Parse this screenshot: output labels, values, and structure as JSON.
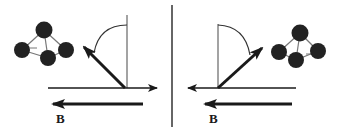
{
  "figure": {
    "left_panel": {
      "field_label": "B",
      "field_direction": "left",
      "molecule_side": "left",
      "moment_direction": "up-left",
      "axis_direction": "right"
    },
    "right_panel": {
      "field_label": "B",
      "field_direction": "left",
      "molecule_side": "right",
      "moment_direction": "up-right",
      "axis_direction": "left"
    },
    "colors": {
      "ink": "#1a1a1a",
      "thin_line": "#555555",
      "atom": "#222222",
      "bond": "#777777",
      "background": "#ffffff"
    }
  }
}
